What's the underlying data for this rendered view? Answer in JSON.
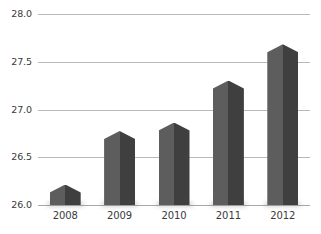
{
  "chart_data": {
    "type": "bar",
    "title": "",
    "subtitle": "",
    "xlabel": "",
    "ylabel": "",
    "categories": [
      "2008",
      "2009",
      "2010",
      "2011",
      "2012"
    ],
    "values": [
      26.13,
      26.69,
      26.78,
      27.22,
      27.6
    ],
    "ylim": [
      26.0,
      28.0
    ],
    "ytick_labels": [
      "26.0",
      "26.5",
      "27.0",
      "27.5",
      "28.0"
    ],
    "ytick_values": [
      26.0,
      26.5,
      27.0,
      27.5,
      28.0
    ],
    "grid": true,
    "legend": false,
    "legend_position": "none",
    "series": [
      {
        "name": "",
        "values": [
          26.13,
          26.69,
          26.78,
          27.22,
          27.6
        ]
      }
    ],
    "bar_style": "pentagon-arrow-top",
    "colors": {
      "bar_light_face": "#5d5d5d",
      "bar_dark_face": "#3f3f3f",
      "gridline": "#b9b9b9",
      "axis_baseline": "#a8a8a8",
      "tick_label": "#3a3a3a",
      "background": "#ffffff"
    }
  },
  "caption": {
    "cropped_text": ""
  }
}
